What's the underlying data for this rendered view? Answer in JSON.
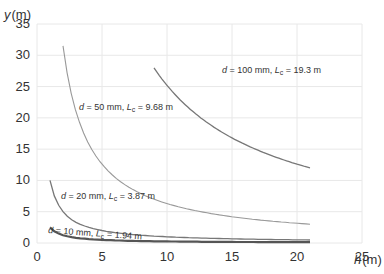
{
  "chart_data": {
    "type": "line",
    "title": "",
    "xlabel": "h (m)",
    "ylabel": "y (m)",
    "xlim": [
      0,
      25
    ],
    "ylim": [
      0,
      35
    ],
    "xticks": [
      0,
      5,
      10,
      15,
      20,
      25
    ],
    "yticks": [
      0,
      5,
      10,
      15,
      20,
      25,
      30,
      35
    ],
    "grid": true,
    "legend": "inline labels",
    "series": [
      {
        "name": "d = 10 mm, Lc = 1.94 m",
        "d": "10 mm",
        "Lc": "1.94 m",
        "x": [
          1,
          2,
          3,
          5,
          8,
          12,
          16,
          21
        ],
        "y": [
          2.5,
          1.25,
          0.83,
          0.5,
          0.31,
          0.21,
          0.16,
          0.12
        ]
      },
      {
        "name": "d = 20 mm, Lc = 3.87 m",
        "d": "20 mm",
        "Lc": "3.87 m",
        "x": [
          1,
          1.5,
          2,
          3,
          5,
          8,
          12,
          16,
          21
        ],
        "y": [
          10,
          6.7,
          5,
          3.3,
          2,
          1.25,
          0.83,
          0.63,
          0.48
        ]
      },
      {
        "name": "d = 50 mm, Lc = 9.68 m",
        "d": "50 mm",
        "Lc": "9.68 m",
        "x": [
          2,
          3,
          4,
          5,
          7,
          10,
          13,
          16,
          19,
          21
        ],
        "y": [
          31.5,
          21,
          15.75,
          12.6,
          9,
          6.3,
          4.85,
          3.94,
          3.32,
          3.0
        ]
      },
      {
        "name": "d = 100 mm, Lc = 19.3 m",
        "d": "100 mm",
        "Lc": "19.3 m",
        "x": [
          9,
          10,
          12,
          14,
          16,
          18,
          21
        ],
        "y": [
          28,
          25.2,
          21,
          18,
          15.75,
          14,
          12
        ]
      }
    ]
  },
  "labels": {
    "y_axis_var": "y",
    "y_axis_unit": "(m)",
    "x_axis_var": "h",
    "x_axis_unit": "(m)",
    "curve_labels": [
      {
        "d": "d",
        "eq1": " = 10 mm, ",
        "L": "L",
        "sub": "c",
        "eq2": " = 1.94 m"
      },
      {
        "d": "d",
        "eq1": " = 20 mm, ",
        "L": "L",
        "sub": "c",
        "eq2": " = 3.87 m"
      },
      {
        "d": "d",
        "eq1": " = 50 mm, ",
        "L": "L",
        "sub": "c",
        "eq2": " = 9.68 m"
      },
      {
        "d": "d",
        "eq1": " = 100 mm, ",
        "L": "L",
        "sub": "c",
        "eq2": " = 19.3 m"
      }
    ]
  }
}
